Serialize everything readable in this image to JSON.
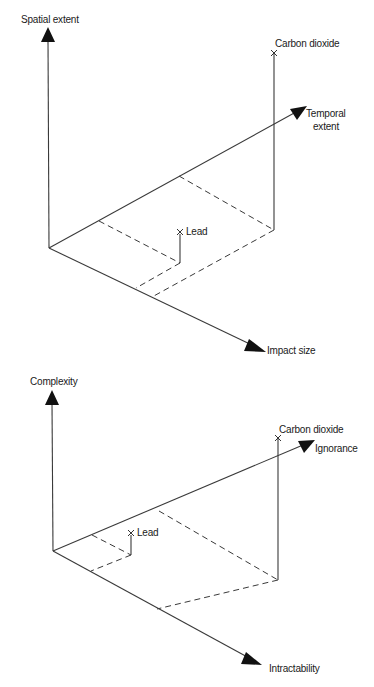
{
  "diagrams": [
    {
      "id": "hazard-extent",
      "axes": {
        "vertical": "Spatial extent",
        "depth": "Temporal extent",
        "depth_line1": "Temporal",
        "depth_line2": "extent",
        "horizontal": "Impact size"
      },
      "points": [
        {
          "label": "Carbon dioxide"
        },
        {
          "label": "Lead"
        }
      ]
    },
    {
      "id": "knowledge-problem",
      "axes": {
        "vertical": "Complexity",
        "depth": "Ignorance",
        "horizontal": "Intractability"
      },
      "points": [
        {
          "label": "Carbon dioxide"
        },
        {
          "label": "Lead"
        }
      ]
    }
  ],
  "colors": {
    "line": "#3a3a3a",
    "arrow": "#111111",
    "text": "#1a1a1a",
    "background": "#ffffff"
  }
}
